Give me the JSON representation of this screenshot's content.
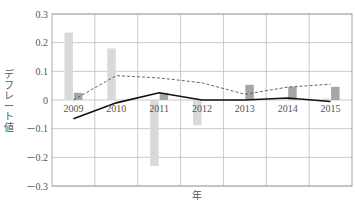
{
  "chart_data": {
    "type": "bar",
    "title": "",
    "xlabel": "年",
    "ylabel": "デフレート値",
    "categories": [
      "2009",
      "2010",
      "2011",
      "2012",
      "2013",
      "2014",
      "2015"
    ],
    "ylim": [
      -0.3,
      0.3
    ],
    "yticks": [
      0.3,
      0.2,
      0.1,
      0,
      -0.1,
      -0.2,
      -0.3
    ],
    "ytick_labels": [
      "0.3",
      "0.2",
      "0.1",
      "0",
      "－0.1",
      "－0.2",
      "－0.3"
    ],
    "grid": true,
    "legend": null,
    "series": [
      {
        "name": "bar-light",
        "kind": "bar",
        "color": "#d9d9d9",
        "values": [
          0.235,
          0.18,
          -0.23,
          -0.088,
          -0.003,
          0.003,
          0.005
        ]
      },
      {
        "name": "bar-dark",
        "kind": "bar",
        "color": "#a6a6a6",
        "values": [
          0.025,
          0.0,
          0.025,
          0.0,
          0.053,
          0.046,
          0.046
        ]
      },
      {
        "name": "line-dashed",
        "kind": "line",
        "style": "dashed",
        "color": "#555555",
        "values": [
          0.0,
          0.085,
          0.077,
          0.06,
          0.02,
          0.045,
          0.055
        ]
      },
      {
        "name": "line-solid",
        "kind": "line",
        "style": "solid",
        "color": "#111111",
        "values": [
          -0.065,
          -0.01,
          0.025,
          0.0,
          0.0,
          0.007,
          -0.005
        ]
      }
    ]
  },
  "layout": {
    "plot": {
      "left": 52,
      "right": 352,
      "top": 14,
      "bottom": 186
    }
  }
}
